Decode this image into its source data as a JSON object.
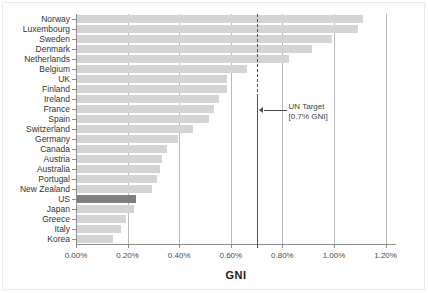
{
  "chart": {
    "type": "bar-horizontal",
    "axis_title": "GNI",
    "annotation": {
      "line1": "UN Target",
      "line2": "[0.7% GNI]",
      "value": 0.7
    },
    "highlight_country": "US",
    "colors": {
      "bar": "#d4d4d4",
      "bar_highlight": "#7f7f7f",
      "gridline": "#b9b9b9",
      "axis": "#8c8c8c",
      "target_line": "#4f4f4f",
      "text": "#333333"
    }
  },
  "chart_data": {
    "type": "bar",
    "title": "",
    "xlabel": "GNI",
    "ylabel": "",
    "orientation": "horizontal",
    "xlim": [
      0,
      1.2
    ],
    "xticks": [
      0.0,
      0.2,
      0.4,
      0.6,
      0.8,
      1.0,
      1.2
    ],
    "xticklabels": [
      "0.00%",
      "0.20%",
      "0.40%",
      "0.60%",
      "0.80%",
      "1.00%",
      "1.20%"
    ],
    "grid": true,
    "legend": false,
    "reference_line": {
      "value": 0.7,
      "label": "UN Target [0.7% GNI]",
      "style": "dashed"
    },
    "categories": [
      "Norway",
      "Luxembourg",
      "Sweden",
      "Denmark",
      "Netherlands",
      "Belgium",
      "UK",
      "Finland",
      "Ireland",
      "France",
      "Spain",
      "Switzerland",
      "Germany",
      "Canada",
      "Austria",
      "Australia",
      "Portugal",
      "New Zealand",
      "US",
      "Japan",
      "Greece",
      "Italy",
      "Korea"
    ],
    "values": [
      1.11,
      1.09,
      0.99,
      0.91,
      0.82,
      0.66,
      0.58,
      0.58,
      0.55,
      0.53,
      0.51,
      0.45,
      0.39,
      0.35,
      0.33,
      0.32,
      0.31,
      0.29,
      0.23,
      0.22,
      0.19,
      0.17,
      0.14
    ],
    "highlighted": [
      "US"
    ]
  }
}
